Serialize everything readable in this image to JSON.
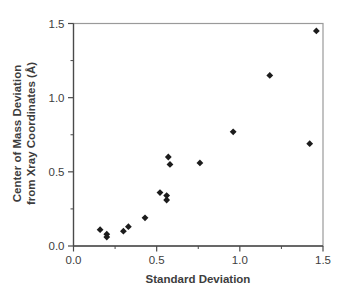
{
  "figure": {
    "kind": "scatter-plot-figure",
    "background": "#ffffff"
  },
  "chart_data": {
    "type": "scatter",
    "title": "",
    "xlabel": "Standard Deviation",
    "ylabel": "Center of Mass Deviation from Xray Coordinates (Å)",
    "ylabel_line1": "Center of Mass Deviation",
    "ylabel_line2": "from Xray Coordinates (Å)",
    "xlim": [
      0,
      1.5
    ],
    "ylim": [
      0,
      1.5
    ],
    "x_major_ticks": [
      0,
      0.5,
      1.0,
      1.5
    ],
    "x_minor_ticks": [
      0.25,
      0.75,
      1.25
    ],
    "y_major_ticks": [
      0,
      0.5,
      1.0,
      1.5
    ],
    "y_minor_ticks": [
      0.25,
      0.75,
      1.25
    ],
    "x_tick_labels": [
      "0.0",
      "0.5",
      "1.0",
      "1.5"
    ],
    "y_tick_labels": [
      "0.0",
      "0.5",
      "1.0",
      "1.5"
    ],
    "grid": false,
    "legend": false,
    "marker": "diamond",
    "series": [
      {
        "name": "center-of-mass-deviation-vs-standard-deviation",
        "points": [
          [
            0.16,
            0.11
          ],
          [
            0.2,
            0.08
          ],
          [
            0.2,
            0.06
          ],
          [
            0.3,
            0.1
          ],
          [
            0.33,
            0.13
          ],
          [
            0.43,
            0.19
          ],
          [
            0.52,
            0.36
          ],
          [
            0.56,
            0.34
          ],
          [
            0.56,
            0.31
          ],
          [
            0.57,
            0.6
          ],
          [
            0.58,
            0.55
          ],
          [
            0.76,
            0.56
          ],
          [
            0.96,
            0.77
          ],
          [
            1.18,
            1.15
          ],
          [
            1.42,
            0.69
          ],
          [
            1.46,
            1.45
          ]
        ]
      }
    ],
    "colors": {
      "marker": "#1c1c1c",
      "axis": "#4a4a4a",
      "frame": "#9a9a9a",
      "tick_text": "#3d3d3d",
      "background": "#ffffff"
    }
  }
}
